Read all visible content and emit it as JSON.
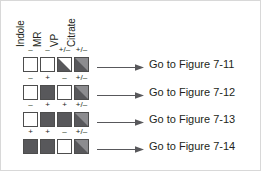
{
  "figure": {
    "columns": [
      {
        "label": "Indole"
      },
      {
        "label": "MR"
      },
      {
        "label": "VP"
      },
      {
        "label": "Citrate"
      }
    ],
    "colors": {
      "box_border": "#4d4d4d",
      "positive_fill": "#58585b",
      "negative_fill": "#ffffff",
      "variable_dark": "#58585b",
      "variable_light": "#ffffff",
      "text": "#231f20",
      "arrow": "#58585b",
      "frame": "#d8d8d8"
    },
    "rows": [
      {
        "name": "row-1",
        "cells": [
          {
            "sign": "–",
            "state": "negative"
          },
          {
            "sign": "–",
            "state": "negative"
          },
          {
            "sign": "+/–",
            "state": "variable-light"
          },
          {
            "sign": "+/–",
            "state": "variable-dark"
          }
        ],
        "arrow_label": "Go to Figure 7-11"
      },
      {
        "name": "row-2",
        "cells": [
          {
            "sign": "–",
            "state": "negative"
          },
          {
            "sign": "+",
            "state": "positive"
          },
          {
            "sign": "–",
            "state": "negative"
          },
          {
            "sign": "+/–",
            "state": "variable-dark"
          }
        ],
        "arrow_label": "Go to Figure 7-12"
      },
      {
        "name": "row-3",
        "cells": [
          {
            "sign": "–",
            "state": "negative"
          },
          {
            "sign": "+",
            "state": "positive"
          },
          {
            "sign": "+",
            "state": "positive"
          },
          {
            "sign": "+/–",
            "state": "variable-dark"
          }
        ],
        "arrow_label": "Go to Figure 7-13"
      },
      {
        "name": "row-4",
        "cells": [
          {
            "sign": "+",
            "state": "positive"
          },
          {
            "sign": "+",
            "state": "positive"
          },
          {
            "sign": "–",
            "state": "negative"
          },
          {
            "sign": "+/–",
            "state": "variable-dark"
          }
        ],
        "arrow_label": "Go to Figure 7-14"
      }
    ]
  }
}
